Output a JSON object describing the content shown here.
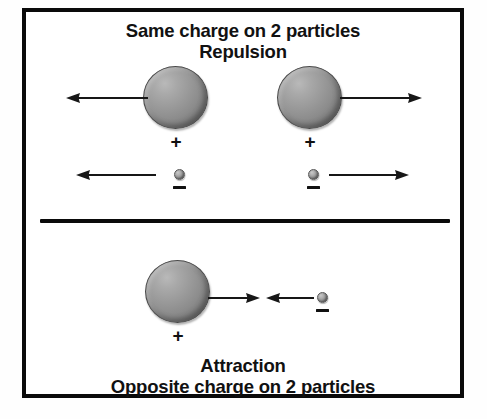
{
  "figure": {
    "background_color": "#ffffff",
    "frame_color": "#0a0a0a",
    "ink_color": "#171717",
    "sphere_color": "#8d8d8d"
  },
  "top_panel": {
    "heading_line1": "Same charge on 2 particles",
    "heading_line2": "Repulsion",
    "proton_left": {
      "charge_label": "+"
    },
    "proton_right": {
      "charge_label": "+"
    },
    "electron_left": {
      "charge_label": "–"
    },
    "electron_right": {
      "charge_label": "–"
    },
    "arrows": [
      {
        "name": "proton-left-force",
        "direction": "left"
      },
      {
        "name": "proton-right-force",
        "direction": "right"
      },
      {
        "name": "electron-left-force",
        "direction": "left"
      },
      {
        "name": "electron-right-force",
        "direction": "right"
      }
    ]
  },
  "bottom_panel": {
    "proton": {
      "charge_label": "+"
    },
    "electron": {
      "charge_label": "–"
    },
    "arrows": [
      {
        "name": "proton-force",
        "direction": "right"
      },
      {
        "name": "electron-force",
        "direction": "left"
      }
    ],
    "caption_line1": "Attraction",
    "caption_line2": "Opposite charge on 2 particles"
  }
}
